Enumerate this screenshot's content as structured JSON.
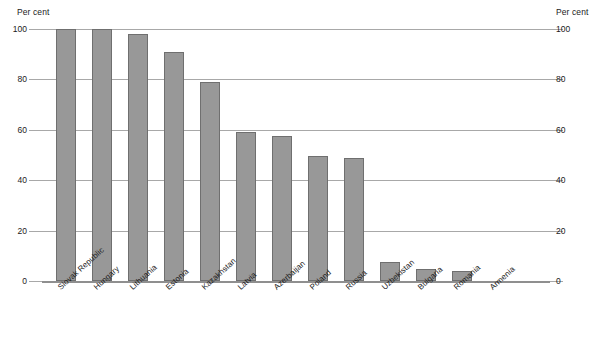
{
  "chart_data": {
    "type": "bar",
    "title": "",
    "xlabel": "",
    "ylabel": "Per cent",
    "ylabel_right": "Per cent",
    "ylim": [
      0,
      100
    ],
    "yticks": [
      0,
      20,
      40,
      60,
      80,
      100
    ],
    "grid": true,
    "legend": "none",
    "bar_color": "#989898",
    "bar_border_color": "#6f6f6f",
    "gridline_color": "#a8a8a8",
    "categories": [
      "Slovak Republic",
      "Hungary",
      "Lithuania",
      "Estonia",
      "Kazakhstan",
      "Latvia",
      "Azerbaijan",
      "Poland",
      "Russia",
      "Uzbekistan",
      "Bulgaria",
      "Romania",
      "Armenia"
    ],
    "values": [
      100,
      100,
      98,
      91,
      79,
      59,
      57.5,
      49.5,
      49,
      7.5,
      4.8,
      4,
      0
    ]
  },
  "axes": {
    "left_caption": "Per cent",
    "right_caption": "Per cent",
    "tick_labels": [
      "100",
      "80",
      "60",
      "40",
      "20",
      "0"
    ]
  }
}
